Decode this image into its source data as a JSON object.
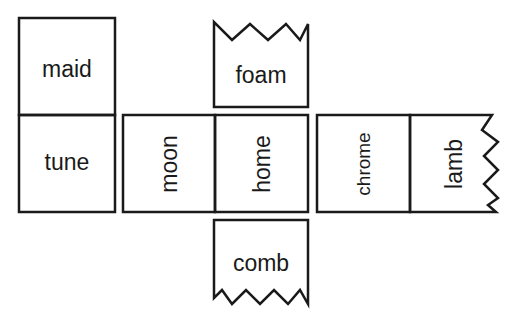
{
  "diagram": {
    "title": "",
    "stroke_color": "#1a1a1a",
    "background": "#ffffff",
    "panels": [
      {
        "id": "maid",
        "label": "maid",
        "orientation": "horizontal"
      },
      {
        "id": "tune",
        "label": "tune",
        "orientation": "horizontal"
      },
      {
        "id": "foam",
        "label": "foam",
        "orientation": "horizontal",
        "torn_edge": "top"
      },
      {
        "id": "moon",
        "label": "moon",
        "orientation": "vertical"
      },
      {
        "id": "home",
        "label": "home",
        "orientation": "vertical"
      },
      {
        "id": "comb",
        "label": "comb",
        "orientation": "horizontal",
        "torn_edge": "bottom"
      },
      {
        "id": "chrome",
        "label": "chrome",
        "orientation": "vertical"
      },
      {
        "id": "lamb",
        "label": "lamb",
        "orientation": "vertical",
        "torn_edge": "right"
      }
    ]
  }
}
